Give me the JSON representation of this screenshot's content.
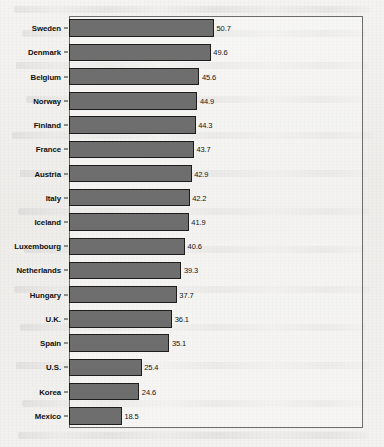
{
  "chart_data": {
    "type": "bar",
    "orientation": "horizontal",
    "title": "",
    "subtitle": "",
    "xlabel": "",
    "ylabel": "",
    "xlim": [
      0,
      102.8
    ],
    "ylim": null,
    "grid": false,
    "legend": null,
    "legend_position": "none",
    "value_labels_shown": true,
    "axis_tick_labels_x": [],
    "categories": [
      "Sweden",
      "Denmark",
      "Belgium",
      "Norway",
      "Finland",
      "France",
      "Austria",
      "Italy",
      "Iceland",
      "Luxembourg",
      "Netherlands",
      "Hungary",
      "U.K.",
      "Spain",
      "U.S.",
      "Korea",
      "Mexico"
    ],
    "values": [
      50.7,
      49.6,
      45.6,
      44.9,
      44.3,
      43.7,
      42.9,
      42.2,
      41.9,
      40.6,
      39.3,
      37.7,
      36.1,
      35.1,
      25.4,
      24.6,
      18.5
    ],
    "value_label_text": [
      "50.7",
      "49.6",
      "45.6",
      "44.9",
      "44.3",
      "43.7",
      "42.9",
      "42.2",
      "41.9",
      "40.6",
      "39.3",
      "37.7",
      "36.1",
      "35.1",
      "25.4",
      "24.6",
      "18.5"
    ],
    "colors": {
      "bar_fill": "#6e6e6e",
      "bar_edge": "#1d1d1d",
      "plot_frame": "#6d6d6d",
      "page_background": "#f2f1ef",
      "text": "#101010"
    }
  }
}
